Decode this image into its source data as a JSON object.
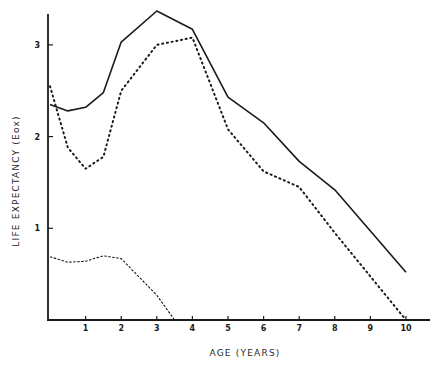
{
  "chart_data": {
    "type": "line",
    "title": "",
    "xlabel": "AGE (YEARS)",
    "ylabel": "LIFE EXPECTANCY (Eox)",
    "xlim": [
      0,
      10.6
    ],
    "ylim": [
      0,
      3.35
    ],
    "x_ticks": [
      1,
      2,
      3,
      4,
      5,
      6,
      7,
      8,
      9,
      10
    ],
    "y_ticks": [
      1,
      2,
      3
    ],
    "grid": false,
    "legend": null,
    "series": [
      {
        "name": "solid",
        "style": "solid",
        "x": [
          0,
          0.5,
          1,
          1.5,
          2,
          3,
          4,
          5,
          6,
          7,
          8,
          10
        ],
        "y": [
          2.35,
          2.28,
          2.32,
          2.48,
          3.03,
          3.37,
          3.17,
          2.43,
          2.15,
          1.73,
          1.42,
          0.52
        ]
      },
      {
        "name": "dotted",
        "style": "dotted",
        "x": [
          0,
          0.5,
          1,
          1.5,
          2,
          3,
          4,
          5,
          6,
          7,
          8,
          10
        ],
        "y": [
          2.55,
          1.88,
          1.65,
          1.78,
          2.5,
          3.0,
          3.08,
          2.08,
          1.62,
          1.45,
          0.95,
          0.0
        ]
      },
      {
        "name": "dashed",
        "style": "dashed",
        "x": [
          0,
          0.5,
          1,
          1.5,
          2,
          3,
          3.5
        ],
        "y": [
          0.69,
          0.63,
          0.64,
          0.7,
          0.67,
          0.27,
          0.0
        ]
      }
    ]
  },
  "colors": {
    "line": "#1a1a1a",
    "background": "#ffffff"
  }
}
